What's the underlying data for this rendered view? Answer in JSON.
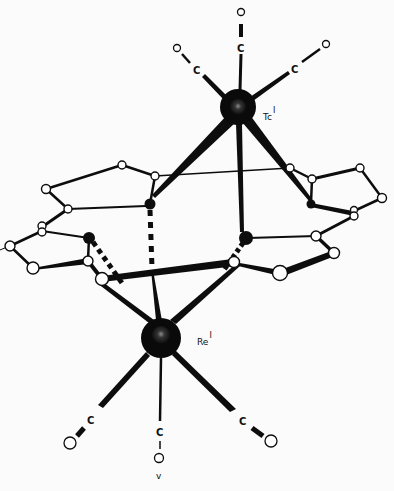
{
  "diagram": {
    "background": "#fbfbfb",
    "ink": "#0d0d0d",
    "metals": [
      {
        "id": "tc",
        "symbol": "Tc",
        "oxidation": "I",
        "x": 238,
        "y": 107,
        "r": 18,
        "label_x": 263,
        "label_y": 117
      },
      {
        "id": "re",
        "symbol": "Re",
        "oxidation": "I",
        "x": 161,
        "y": 338,
        "r": 20,
        "label_x": 198,
        "label_y": 341
      }
    ],
    "carbonyls": [
      {
        "metal": "tc",
        "c": {
          "label": "C",
          "x": 241,
          "y": 48
        },
        "o": {
          "label": "O",
          "x": 241,
          "y": 12
        }
      },
      {
        "metal": "tc",
        "c": {
          "label": "C",
          "x": 197,
          "y": 71
        },
        "o": {
          "label": "O",
          "x": 177,
          "y": 48
        }
      },
      {
        "metal": "tc",
        "c": {
          "label": "C",
          "x": 296,
          "y": 69
        },
        "o": {
          "label": "O",
          "x": 326,
          "y": 44
        }
      },
      {
        "metal": "re",
        "c": {
          "label": "C",
          "x": 91,
          "y": 420
        },
        "o": {
          "label": "O",
          "x": 70,
          "y": 443
        }
      },
      {
        "metal": "re",
        "c": {
          "label": "C",
          "x": 160,
          "y": 432
        },
        "o": {
          "label": "O",
          "x": 159,
          "y": 458
        }
      },
      {
        "metal": "re",
        "c": {
          "label": "C",
          "x": 243,
          "y": 421
        },
        "o": {
          "label": "O",
          "x": 271,
          "y": 441
        }
      }
    ],
    "footer_label": "v"
  }
}
